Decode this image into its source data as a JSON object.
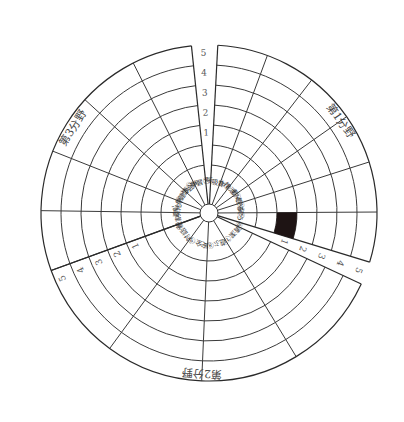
{
  "chart_data": {
    "type": "radial-wheel",
    "title": "",
    "scale": {
      "min": 1,
      "max": 5,
      "tick_labels": [
        "1",
        "2",
        "3",
        "4",
        "5"
      ]
    },
    "fields": [
      {
        "name": "第1分野",
        "items": [
          {
            "no": "①",
            "label": "呼吸"
          },
          {
            "no": "②",
            "label": "食"
          },
          {
            "no": "③",
            "label": "排泄"
          },
          {
            "no": "④",
            "label": "動く"
          },
          {
            "no": "⑤",
            "label": "眠る"
          },
          {
            "no": "⑥",
            "label": "装う"
          }
        ]
      },
      {
        "name": "第2分野",
        "items": [
          {
            "no": "⑦",
            "label": "清潔"
          },
          {
            "no": "⑧",
            "label": "遊ぶ"
          },
          {
            "no": "⑨",
            "label": "安全"
          },
          {
            "no": "⑩",
            "label": "対話"
          }
        ]
      },
      {
        "name": "第3分野",
        "items": [
          {
            "no": "⑪",
            "label": "役割"
          },
          {
            "no": "⑫",
            "label": "変化"
          },
          {
            "no": "⑬",
            "label": "心身健康"
          },
          {
            "no": "⑭",
            "label": "社会"
          },
          {
            "no": "⑮",
            "label": "学習"
          }
        ]
      }
    ],
    "sub_labels": [
      "4",
      "1",
      "5"
    ],
    "shaded_cells": [
      {
        "field": "第1分野",
        "item": "⑥",
        "from_level": 1,
        "to_level": 2
      }
    ],
    "layout": {
      "center": [
        209,
        213
      ],
      "hub_radius": 9,
      "label_ring_radius": 48,
      "level_radii": [
        68,
        88,
        108,
        128,
        148,
        168
      ],
      "field_arcs_deg": [
        {
          "field": 0,
          "start": 87,
          "end": -17
        },
        {
          "field": 1,
          "start": -25,
          "end": -160
        },
        {
          "field": 2,
          "start": 200,
          "end": 96
        }
      ],
      "scale_axes_deg": [
        92,
        -21,
        204
      ]
    },
    "colors": {
      "line": "#333333",
      "shade": "#1e1414",
      "background": "#ffffff"
    }
  }
}
